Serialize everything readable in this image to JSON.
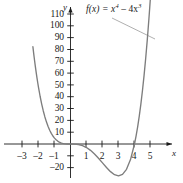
{
  "figure": {
    "function_label_parts": {
      "prefix": "f(x) = x",
      "exp1": "4",
      "minus": " – 4x",
      "exp2": "3"
    },
    "function_label_plain": "f(x) = x⁴ – 4x³",
    "axis_name_x": "x",
    "axis_name_y": "y",
    "curve_color": "#7d7d7d",
    "axis_color": "#1a1a1a",
    "text_color": "#1a1a1a",
    "background_color": "#ffffff",
    "leader_line_color": "#9a9a9a"
  },
  "chart_data": {
    "type": "line",
    "xlabel": "x",
    "ylabel": "y",
    "expression": "x^4 - 4x^3",
    "xlim": [
      -3.6,
      5.8
    ],
    "ylim": [
      -30,
      118
    ],
    "grid": false,
    "legend": "none",
    "legend_position": "none",
    "annotations": [
      {
        "text": "f(x) = x⁴ – 4x³",
        "x_px": 86,
        "y_px": 5,
        "leader_from_px": [
          112,
          18
        ],
        "leader_to_px": [
          155,
          39
        ]
      }
    ],
    "xticks": [
      -3,
      -2,
      -1,
      1,
      2,
      3,
      4,
      5
    ],
    "xtick_labels": [
      "–3",
      "–2",
      "–1",
      "1",
      "2",
      "3",
      "4",
      "5"
    ],
    "yticks": [
      -20,
      10,
      20,
      30,
      40,
      50,
      60,
      70,
      80,
      90,
      100,
      110
    ],
    "ytick_labels": [
      "–20",
      "10",
      "20",
      "30",
      "40",
      "50",
      "60",
      "70",
      "80",
      "90",
      "100",
      "110"
    ],
    "roots": [
      0,
      4
    ],
    "local_minimum": {
      "x": 3,
      "y": -27
    },
    "inflection_points": [
      {
        "x": 0,
        "y": 0
      },
      {
        "x": 2,
        "y": -16
      }
    ],
    "x": [
      -2.0,
      -1.9,
      -1.8,
      -1.7,
      -1.6,
      -1.5,
      -1.4,
      -1.3,
      -1.2,
      -1.1,
      -1.0,
      -0.9,
      -0.8,
      -0.7,
      -0.6,
      -0.5,
      -0.4,
      -0.3,
      -0.2,
      -0.1,
      0.0,
      0.25,
      0.5,
      0.75,
      1.0,
      1.25,
      1.5,
      1.75,
      2.0,
      2.25,
      2.5,
      2.75,
      3.0,
      3.25,
      3.5,
      3.75,
      4.0,
      4.1,
      4.2,
      4.3,
      4.4,
      4.5,
      4.6,
      4.7,
      4.8
    ],
    "y": [
      48.0,
      40.47,
      33.61,
      27.39,
      31.0,
      18.56,
      14.29,
      11.71,
      8.98,
      6.69,
      5.0,
      3.57,
      2.46,
      1.61,
      1.0,
      0.56,
      0.29,
      0.12,
      0.03,
      0.004,
      0.0,
      -0.06,
      -0.44,
      -1.37,
      -3.0,
      -5.37,
      -8.44,
      -12.0,
      -16.0,
      -19.9,
      -23.44,
      -26.0,
      -27.0,
      -25.74,
      -21.44,
      -13.18,
      0.0,
      7.39,
      16.46,
      25.44,
      38.3,
      50.06,
      64.5,
      81.2,
      99.5
    ]
  },
  "ticks": {
    "y_labels": [
      {
        "value": 110,
        "text": "110",
        "px_y": 14
      },
      {
        "value": 100,
        "text": "100",
        "px_y": 25.8
      },
      {
        "value": 90,
        "text": "90",
        "px_y": 37.6
      },
      {
        "value": 80,
        "text": "80",
        "px_y": 49.5
      },
      {
        "value": 70,
        "text": "70",
        "px_y": 61.3
      },
      {
        "value": 60,
        "text": "60",
        "px_y": 73.1
      },
      {
        "value": 50,
        "text": "50",
        "px_y": 84.9
      },
      {
        "value": 40,
        "text": "40",
        "px_y": 96.7
      },
      {
        "value": 30,
        "text": "30",
        "px_y": 108.5
      },
      {
        "value": 20,
        "text": "20",
        "px_y": 120.4
      },
      {
        "value": 10,
        "text": "10",
        "px_y": 132.2
      },
      {
        "value": -20,
        "text": "–20",
        "px_y": 167.6
      }
    ],
    "x_labels": [
      {
        "value": -3,
        "text": "–3",
        "px_x": 22
      },
      {
        "value": -2,
        "text": "–2",
        "px_x": 38
      },
      {
        "value": -1,
        "text": "–1",
        "px_x": 54
      },
      {
        "value": 1,
        "text": "1",
        "px_x": 86
      },
      {
        "value": 2,
        "text": "2",
        "px_x": 102
      },
      {
        "value": 3,
        "text": "3",
        "px_x": 118
      },
      {
        "value": 4,
        "text": "4",
        "px_x": 134
      },
      {
        "value": 5,
        "text": "5",
        "px_x": 150
      }
    ]
  }
}
